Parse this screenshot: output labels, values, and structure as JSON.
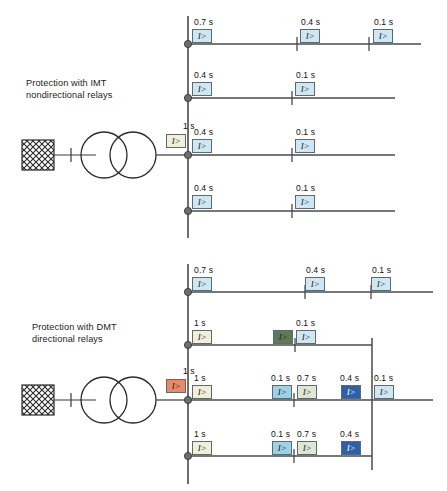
{
  "figure": {
    "sections": [
      {
        "id": "imt",
        "caption": "Protection with IMT\nnondirectional relays",
        "source": {
          "name": "grid-source",
          "symbol": "hatched-square"
        },
        "transformer": {
          "name": "two-winding-transformer",
          "symbol": "two-circles"
        },
        "transformer_relay": {
          "time": "1 s",
          "symbol": "I>",
          "color": "#f2efd9"
        },
        "busbar": {
          "name": "vertical-busbar"
        },
        "feeders": [
          {
            "name": "feeder-1",
            "relays": [
              {
                "time": "0.7 s",
                "symbol": "I>",
                "color": "#cfe7f2"
              },
              {
                "time": "0.4 s",
                "symbol": "I>",
                "color": "#cfe7f2"
              },
              {
                "time": "0.1 s",
                "symbol": "I>",
                "color": "#cfe7f2"
              }
            ]
          },
          {
            "name": "feeder-2",
            "relays": [
              {
                "time": "0.4 s",
                "symbol": "I>",
                "color": "#cfe7f2"
              },
              {
                "time": "0.1 s",
                "symbol": "I>",
                "color": "#cfe7f2"
              }
            ]
          },
          {
            "name": "feeder-3",
            "relays": [
              {
                "time": "0.4 s",
                "symbol": "I>",
                "color": "#cfe7f2"
              },
              {
                "time": "0.1 s",
                "symbol": "I>",
                "color": "#cfe7f2"
              }
            ]
          },
          {
            "name": "feeder-4",
            "relays": [
              {
                "time": "0.4 s",
                "symbol": "I>",
                "color": "#cfe7f2"
              },
              {
                "time": "0.1 s",
                "symbol": "I>",
                "color": "#cfe7f2"
              }
            ]
          }
        ]
      },
      {
        "id": "dmt",
        "caption": "Protection with DMT\ndirectional relays",
        "source": {
          "name": "grid-source",
          "symbol": "hatched-square"
        },
        "transformer": {
          "name": "two-winding-transformer",
          "symbol": "two-circles"
        },
        "transformer_relay": {
          "time": "1 s",
          "symbol": "I>",
          "color": "#e8896a"
        },
        "busbar": {
          "name": "vertical-busbar"
        },
        "feeders": [
          {
            "name": "feeder-1",
            "relays": [
              {
                "time": "0.7 s",
                "symbol": "I>",
                "color": "#cfe7f2"
              },
              {
                "time": "0.4 s",
                "symbol": "I>",
                "color": "#cfe7f2"
              },
              {
                "time": "0.1 s",
                "symbol": "I>",
                "color": "#cfe7f2"
              }
            ]
          },
          {
            "name": "feeder-2",
            "relays": [
              {
                "time": "1 s",
                "symbol": "I>",
                "color": "#f2efd9"
              },
              {
                "time": "",
                "symbol": "I>",
                "color": "#5f7a55"
              },
              {
                "time": "0.1 s",
                "symbol": "I>",
                "color": "#cfe7f2"
              }
            ]
          },
          {
            "name": "feeder-3",
            "relays": [
              {
                "time": "1 s",
                "symbol": "I>",
                "color": "#f2efd9"
              },
              {
                "time": "0.1 s",
                "symbol": "I>",
                "color": "#9ed0e6"
              },
              {
                "time": "0.7 s",
                "symbol": "I>",
                "color": "#dfe6d5"
              },
              {
                "time": "0.4 s",
                "symbol": "I>",
                "color": "#2f5fa8"
              },
              {
                "time": "0.1 s",
                "symbol": "I>",
                "color": "#cfe7f2"
              }
            ]
          },
          {
            "name": "feeder-4",
            "relays": [
              {
                "time": "1 s",
                "symbol": "I>",
                "color": "#f2efd9"
              },
              {
                "time": "0.1 s",
                "symbol": "I>",
                "color": "#9ed0e6"
              },
              {
                "time": "0.7 s",
                "symbol": "I>",
                "color": "#dfe6d5"
              },
              {
                "time": "0.4 s",
                "symbol": "I>",
                "color": "#2f5fa8"
              }
            ]
          }
        ]
      }
    ],
    "colors": {
      "line": "#4a4a4a",
      "relay_border": "#5d6a72",
      "text": "#1a1a1a",
      "blue_light": "#cfe7f2",
      "cream": "#f2efd9",
      "orange": "#e8896a",
      "green_dark": "#5f7a55",
      "blue_dark": "#2f5fa8"
    }
  }
}
